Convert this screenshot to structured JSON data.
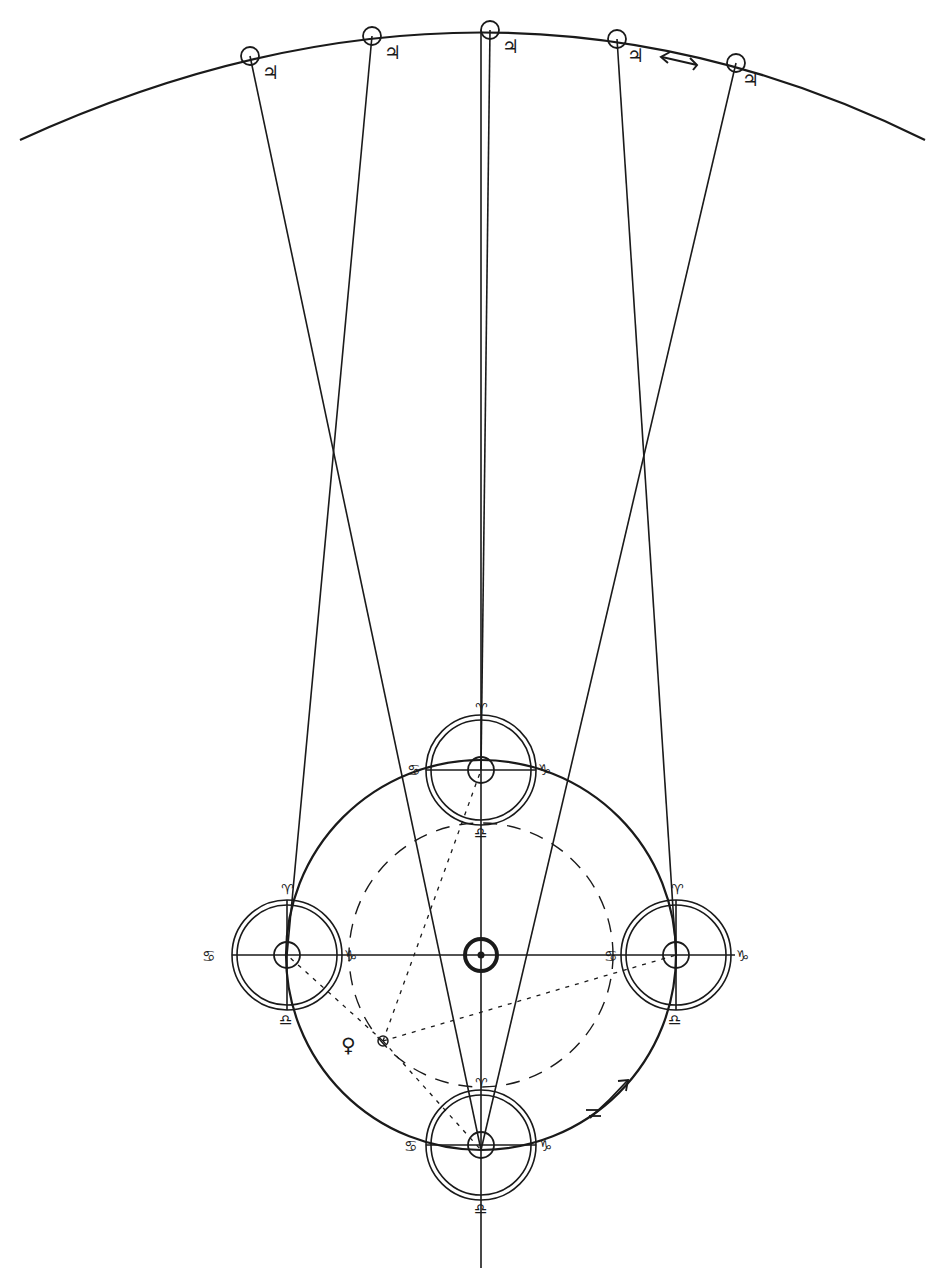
{
  "diagram": {
    "colors": {
      "ink": "#1a1a1a",
      "paper": "#ffffff"
    },
    "outer_orbit": {
      "name": "Jupiter orbit arc",
      "planet_symbol": "♃",
      "positions": 5,
      "direction_arrow": "←"
    },
    "inner_orbit": {
      "name": "Earth orbit",
      "direction_arrow": "↗",
      "direction_symbol": "♐"
    },
    "sun": {
      "symbol": "☉"
    },
    "dashed_orbit": {
      "name": "Venus orbit"
    },
    "venus": {
      "symbol": "♀",
      "marker": "☊"
    },
    "earth_positions": [
      {
        "id": "top",
        "north": "♈",
        "west": "♋",
        "east": "♑",
        "south": "♎"
      },
      {
        "id": "left",
        "north": "♈",
        "west": "♋",
        "east": "♑",
        "south": "♎"
      },
      {
        "id": "right",
        "north": "♈",
        "west": "♋",
        "east": "♑",
        "south": "♎"
      },
      {
        "id": "bottom",
        "north": "♈",
        "west": "♋",
        "east": "♑",
        "south": "♎"
      }
    ],
    "jupiter_labels": [
      "♃",
      "♃",
      "♃",
      "♃",
      "♃"
    ]
  }
}
